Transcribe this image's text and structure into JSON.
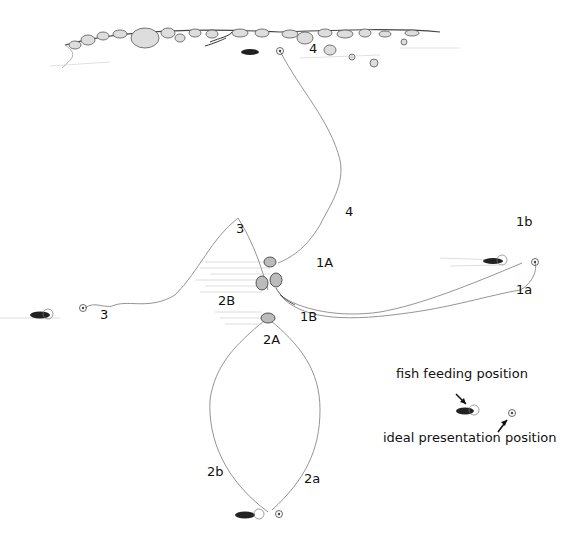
{
  "diagram": {
    "type": "fly-fishing drift / presentation illustration",
    "labels": {
      "l4_top": "4",
      "l4_mid": "4",
      "l3_upper": "3",
      "l3_left": "3",
      "l1A": "1A",
      "l1B": "1B",
      "l1a": "1a",
      "l1b": "1b",
      "l2A": "2A",
      "l2B": "2B",
      "l2a": "2a",
      "l2b": "2b"
    },
    "legend": {
      "fish_feeding": "fish feeding position",
      "ideal_presentation": "ideal presentation position"
    },
    "colors": {
      "line": "#888888",
      "ink": "#111111",
      "shade": "#bbbbbb"
    }
  }
}
